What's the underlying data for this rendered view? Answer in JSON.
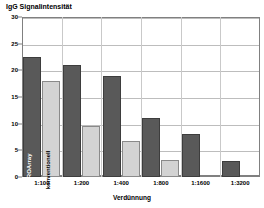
{
  "chart_data": {
    "type": "bar",
    "title": "IgG Signalintensität",
    "xlabel": "Verdünnung",
    "ylabel": "",
    "categories": [
      "1:100",
      "1:200",
      "1:400",
      "1:800",
      "1:1600",
      "1:3200"
    ],
    "series": [
      {
        "name": "EUROArray",
        "color": "#595959",
        "values": [
          22.5,
          21.0,
          19.0,
          11.0,
          8.0,
          3.0
        ]
      },
      {
        "name": "konventionell",
        "color": "#d3d3d3",
        "values": [
          18.0,
          9.5,
          6.8,
          3.2,
          0,
          0
        ]
      }
    ],
    "ylim": [
      0,
      30
    ],
    "yticks": [
      0,
      5,
      10,
      15,
      20,
      25,
      30
    ],
    "ytick_labels": [
      "0",
      "5",
      "10",
      "15",
      "20",
      "25",
      "30"
    ],
    "grid": true,
    "legend_position": "inline-first-group",
    "inline_labels": [
      "EUROArray",
      "konventionell"
    ]
  }
}
